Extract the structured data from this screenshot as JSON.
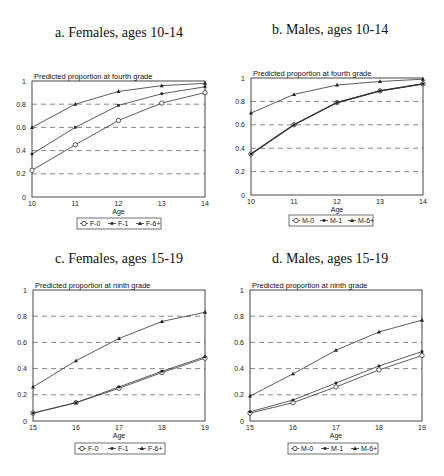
{
  "chart_data": [
    {
      "type": "line",
      "panel": "a",
      "title": "a. Females, ages 10-14",
      "ylabel": "Predicted proportion at fourth grade",
      "xlabel": "Age",
      "x": [
        10,
        11,
        12,
        13,
        14
      ],
      "xticks": [
        "10",
        "11",
        "12",
        "13",
        "14"
      ],
      "yticks": [
        "0",
        "0.2",
        "0.4",
        "0.6",
        "0.8",
        "1"
      ],
      "ylim": [
        0,
        1
      ],
      "grid": "dashed horizontal at 0.2 intervals",
      "legend_position": "bottom",
      "series": [
        {
          "name": "F-0",
          "marker": "open-circle",
          "values": [
            0.23,
            0.45,
            0.66,
            0.81,
            0.9
          ]
        },
        {
          "name": "F-1",
          "marker": "small-dot",
          "values": [
            0.37,
            0.6,
            0.79,
            0.89,
            0.95
          ]
        },
        {
          "name": "F-6+",
          "marker": "triangle",
          "values": [
            0.6,
            0.8,
            0.91,
            0.96,
            0.98
          ]
        }
      ]
    },
    {
      "type": "line",
      "panel": "b",
      "title": "b. Males, ages 10-14",
      "ylabel": "Predicted proportion at fourth grade",
      "xlabel": "Age",
      "x": [
        10,
        11,
        12,
        13,
        14
      ],
      "xticks": [
        "10",
        "11",
        "12",
        "13",
        "14"
      ],
      "yticks": [
        "0",
        "0.2",
        "0.4",
        "0.6",
        "0.8",
        "1"
      ],
      "ylim": [
        0,
        1
      ],
      "grid": "dashed horizontal at 0.2 intervals",
      "legend_position": "bottom",
      "series": [
        {
          "name": "M-0",
          "marker": "open-circle",
          "values": [
            0.35,
            0.6,
            0.79,
            0.89,
            0.95
          ]
        },
        {
          "name": "M-1",
          "marker": "small-dot",
          "values": [
            0.35,
            0.6,
            0.79,
            0.89,
            0.95
          ]
        },
        {
          "name": "M-6+",
          "marker": "triangle",
          "values": [
            0.7,
            0.86,
            0.94,
            0.97,
            0.99
          ]
        }
      ]
    },
    {
      "type": "line",
      "panel": "c",
      "title": "c. Females, ages 15-19",
      "ylabel": "Predicted proportion at ninth grade",
      "xlabel": "Age",
      "x": [
        15,
        16,
        17,
        18,
        19
      ],
      "xticks": [
        "15",
        "16",
        "17",
        "18",
        "19"
      ],
      "yticks": [
        "0",
        "0.2",
        "0.4",
        "0.6",
        "0.8",
        "1"
      ],
      "ylim": [
        0,
        1
      ],
      "grid": "dashed horizontal at 0.2 intervals",
      "legend_position": "bottom",
      "series": [
        {
          "name": "F-0",
          "marker": "open-circle",
          "values": [
            0.06,
            0.14,
            0.25,
            0.37,
            0.48
          ]
        },
        {
          "name": "F-1",
          "marker": "small-dot",
          "values": [
            0.06,
            0.14,
            0.26,
            0.38,
            0.49
          ]
        },
        {
          "name": "F-6+",
          "marker": "triangle",
          "values": [
            0.26,
            0.46,
            0.63,
            0.76,
            0.83
          ]
        }
      ]
    },
    {
      "type": "line",
      "panel": "d",
      "title": "d. Males, ages 15-19",
      "ylabel": "Predicted proportion at ninth grade",
      "xlabel": "Age",
      "x": [
        15,
        16,
        17,
        18,
        19
      ],
      "xticks": [
        "15",
        "16",
        "17",
        "18",
        "19"
      ],
      "yticks": [
        "0",
        "0.2",
        "0.4",
        "0.6",
        "0.8",
        "1"
      ],
      "ylim": [
        0,
        1
      ],
      "grid": "dashed horizontal at 0.2 intervals",
      "legend_position": "bottom",
      "series": [
        {
          "name": "M-0",
          "marker": "open-circle",
          "values": [
            0.06,
            0.14,
            0.26,
            0.39,
            0.5
          ]
        },
        {
          "name": "M-1",
          "marker": "small-dot",
          "values": [
            0.07,
            0.16,
            0.29,
            0.42,
            0.53
          ]
        },
        {
          "name": "M-6+",
          "marker": "triangle",
          "values": [
            0.19,
            0.36,
            0.54,
            0.68,
            0.77
          ]
        }
      ]
    }
  ],
  "layout": {
    "panels": [
      {
        "title_x": 55,
        "title_y": 25,
        "left": 32,
        "right": 205,
        "top": 81,
        "bottom": 197,
        "legend_x": 77,
        "legend_y": 218,
        "legend_w": 84
      },
      {
        "title_x": 272,
        "title_y": 22,
        "left": 251,
        "right": 423,
        "top": 78,
        "bottom": 195,
        "legend_x": 289,
        "legend_y": 215,
        "legend_w": 84
      },
      {
        "title_x": 55,
        "title_y": 251,
        "left": 33,
        "right": 205,
        "top": 290,
        "bottom": 421,
        "legend_x": 75,
        "legend_y": 443,
        "legend_w": 90
      },
      {
        "title_x": 272,
        "title_y": 251,
        "left": 250,
        "right": 422,
        "top": 290,
        "bottom": 421,
        "legend_x": 288,
        "legend_y": 443,
        "legend_w": 90
      }
    ]
  }
}
